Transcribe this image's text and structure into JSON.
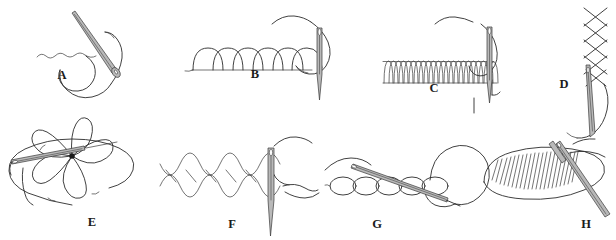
{
  "figure": {
    "background_color": "#ffffff",
    "ink_color": "#2b2b2b",
    "needle_color": "#b9b9b9",
    "width": 616,
    "height": 240,
    "panel_count": 8,
    "label_style": "bold serif capital letters"
  },
  "panels": [
    {
      "id": "a",
      "label": "A",
      "label_x": 62,
      "label_y": 79,
      "stitch_name": "running-stitch",
      "description": "Slanted needle passing through fabric with a wavy running stitch line and looping thread"
    },
    {
      "id": "b",
      "label": "B",
      "label_x": 255,
      "label_y": 78,
      "stitch_name": "blanket-stitch-loose",
      "description": "Row of six rounded loops with a vertical needle at the right and thread over the top"
    },
    {
      "id": "c",
      "label": "C",
      "label_x": 434,
      "label_y": 92,
      "stitch_name": "buttonhole-stitch-close",
      "description": "Dense row of narrow vertical loops with vertical needle at right and a loop of thread"
    },
    {
      "id": "d",
      "label": "D",
      "label_x": 564,
      "label_y": 88,
      "stitch_name": "cross-stitch-column",
      "description": "Vertical column of crossed stitches with a needle emerging below"
    },
    {
      "id": "e",
      "label": "E",
      "label_x": 92,
      "label_y": 226,
      "stitch_name": "lazy-daisy-flower-stitch",
      "description": "Five looped petals radiating from a central dot with a horizontal needle through the fabric"
    },
    {
      "id": "f",
      "label": "F",
      "label_x": 232,
      "label_y": 228,
      "stitch_name": "herringbone-cross-stitch-row",
      "description": "Horizontal row of overlapping crossed loops with a vertical needle at the right"
    },
    {
      "id": "g",
      "label": "G",
      "label_x": 377,
      "label_y": 228,
      "stitch_name": "chain-stitch",
      "description": "Row of five linked oval chain loops with a slanted needle and a large thread loop"
    },
    {
      "id": "h",
      "label": "H",
      "label_x": 586,
      "label_y": 228,
      "stitch_name": "satin-stitch-fill",
      "description": "Oval leaf outline filled with closely packed parallel satin stitches and a slanted needle"
    }
  ]
}
